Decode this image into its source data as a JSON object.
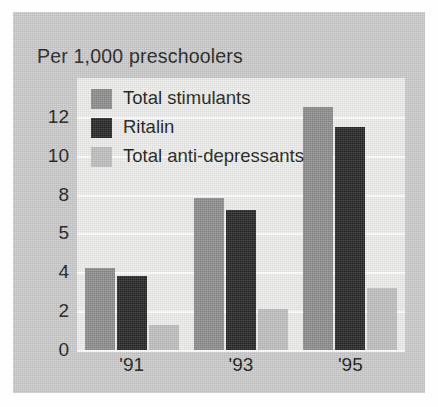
{
  "chart_data": {
    "type": "bar",
    "title": "Per 1,000 preschoolers",
    "xlabel": "",
    "ylabel": "",
    "categories": [
      "'91",
      "'93",
      "'95"
    ],
    "series": [
      {
        "name": "Total stimulants",
        "color": "#8a8a8a",
        "values": [
          4.2,
          7.8,
          12.5
        ]
      },
      {
        "name": "Ritalin",
        "color": "#232323",
        "values": [
          3.8,
          7.2,
          11.5
        ]
      },
      {
        "name": "Total anti-depressants",
        "color": "#bdbdbd",
        "values": [
          1.3,
          2.1,
          3.2
        ]
      }
    ],
    "ytick_labels": [
      "12",
      "10",
      "8",
      "5",
      "4",
      "2",
      "0"
    ],
    "ytick_values": [
      12,
      10,
      8,
      6,
      4,
      2,
      0
    ],
    "ylim": [
      0,
      14
    ],
    "grid": true,
    "legend_position": "top-left-inside",
    "panel_color": "#c9c9c9",
    "plot_background": "#ececeb",
    "gridline_color": "#ffffff"
  },
  "legend": {
    "items": [
      {
        "label": "Total stimulants"
      },
      {
        "label": "Ritalin"
      },
      {
        "label": "Total anti-depressants"
      }
    ]
  }
}
